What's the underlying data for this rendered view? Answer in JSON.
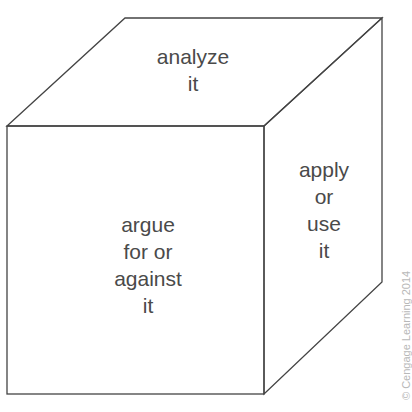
{
  "diagram": {
    "type": "cube",
    "faces": {
      "top": {
        "lines": [
          "analyze",
          "it"
        ]
      },
      "front": {
        "lines": [
          "argue",
          "for or",
          "against",
          "it"
        ]
      },
      "side": {
        "lines": [
          "apply",
          "or",
          "use",
          "it"
        ]
      }
    },
    "stroke_color": "#444444",
    "text_color": "#4a4a4a"
  },
  "copyright": "© Cengage Learning 2014"
}
